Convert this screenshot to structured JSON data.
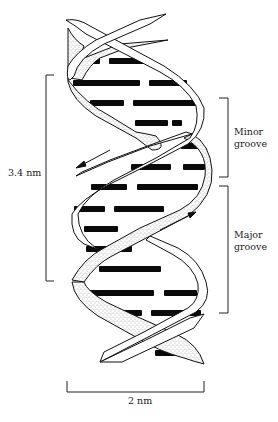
{
  "diagram": {
    "labels": {
      "pitch": "3.4 nm",
      "minor_groove_line1": "Minor",
      "minor_groove_line2": "groove",
      "major_groove_line1": "Major",
      "major_groove_line2": "groove",
      "width": "2 nm"
    },
    "colors": {
      "ink": "#111111",
      "background": "#ffffff",
      "stipple": "#555555",
      "base_pair": "#0a0a0a"
    }
  }
}
